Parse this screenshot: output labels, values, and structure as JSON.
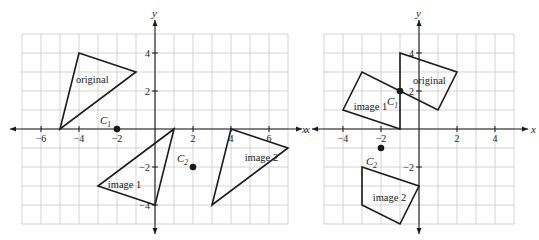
{
  "figures": [
    {
      "id": "left",
      "origin_px": [
        155,
        129
      ],
      "unit_px": 19,
      "grid": {
        "xmin": -7,
        "xmax": 7,
        "ymin": -5,
        "ymax": 5
      },
      "axes": {
        "x_label": "x",
        "y_label": "y"
      },
      "x_ticks": [
        {
          "value": -6,
          "label": "−6"
        },
        {
          "value": -4,
          "label": "−4"
        },
        {
          "value": -2,
          "label": "−2"
        },
        {
          "value": 2,
          "label": "2"
        },
        {
          "value": 4,
          "label": "4"
        },
        {
          "value": 6,
          "label": "6"
        }
      ],
      "y_ticks": [
        {
          "value": 4,
          "label": "4"
        },
        {
          "value": 2,
          "label": "2"
        },
        {
          "value": -2,
          "label": "−2"
        },
        {
          "value": -4,
          "label": "−4"
        }
      ],
      "shapes": [
        {
          "name": "original",
          "label": "original",
          "vertices": [
            [
              -5,
              0
            ],
            [
              -4,
              4
            ],
            [
              -1,
              3
            ]
          ],
          "label_at": [
            -3.3,
            2.6
          ]
        },
        {
          "name": "image-1",
          "label": "image 1",
          "vertices": [
            [
              1,
              0
            ],
            [
              -3,
              -3
            ],
            [
              0,
              -4
            ]
          ],
          "label_at": [
            -1.6,
            -2.9
          ]
        },
        {
          "name": "image-2",
          "label": "image 2",
          "vertices": [
            [
              4,
              0
            ],
            [
              7,
              -1
            ],
            [
              3,
              -4
            ]
          ],
          "label_at": [
            5.6,
            -1.5
          ]
        }
      ],
      "points": [
        {
          "name": "C1",
          "letter": "C",
          "sub": "1",
          "at": [
            -2,
            0
          ],
          "label_offset": [
            -17,
            -5
          ]
        },
        {
          "name": "C2",
          "letter": "C",
          "sub": "2",
          "at": [
            2,
            -2
          ],
          "label_offset": [
            -16,
            -5
          ]
        }
      ]
    },
    {
      "id": "right",
      "origin_px": [
        419,
        129
      ],
      "unit_px": 19,
      "grid": {
        "xmin": -5,
        "xmax": 5,
        "ymin": -5,
        "ymax": 5
      },
      "axes": {
        "x_label": "x",
        "y_label": "y",
        "x_label_left": "x"
      },
      "x_ticks": [
        {
          "value": -4,
          "label": "−4"
        },
        {
          "value": -2,
          "label": "−2"
        },
        {
          "value": 2,
          "label": "2"
        },
        {
          "value": 4,
          "label": "4"
        }
      ],
      "y_ticks": [
        {
          "value": 4,
          "label": "4"
        },
        {
          "value": 2,
          "label": "2"
        },
        {
          "value": -2,
          "label": "−2"
        }
      ],
      "shapes": [
        {
          "name": "original",
          "label": "original",
          "vertices": [
            [
              -1,
              4
            ],
            [
              2,
              3
            ],
            [
              1,
              1
            ],
            [
              -1,
              2
            ]
          ],
          "label_at": [
            0.55,
            2.55
          ]
        },
        {
          "name": "image-1",
          "label": "image 1",
          "vertices": [
            [
              -1,
              0
            ],
            [
              -4,
              1
            ],
            [
              -3,
              3
            ],
            [
              -1,
              2
            ]
          ],
          "label_at": [
            -2.55,
            1.2
          ]
        },
        {
          "name": "image-2",
          "label": "image 2",
          "vertices": [
            [
              -3,
              -2
            ],
            [
              0,
              -3
            ],
            [
              -1,
              -5
            ],
            [
              -3,
              -4
            ]
          ],
          "label_at": [
            -1.55,
            -3.6
          ]
        }
      ],
      "points": [
        {
          "name": "C1",
          "letter": "C",
          "sub": "1",
          "at": [
            -1,
            2
          ],
          "label_offset": [
            -13,
            14
          ]
        },
        {
          "name": "C2",
          "letter": "C",
          "sub": "2",
          "at": [
            -2,
            -1
          ],
          "label_offset": [
            -15,
            17
          ]
        }
      ]
    }
  ]
}
